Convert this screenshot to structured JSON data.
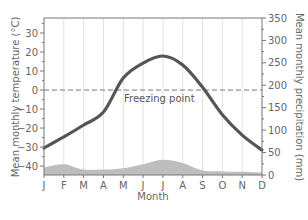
{
  "chart_data": {
    "type": "line",
    "title": "",
    "xlabel": "Month",
    "ylabel": "Mean monthly temperature (°C)",
    "y2label": "Mean monthly precipitation (mm)",
    "categories": [
      "J",
      "F",
      "M",
      "A",
      "M",
      "J",
      "J",
      "A",
      "S",
      "O",
      "N",
      "D"
    ],
    "series": [
      {
        "name": "Mean monthly temperature (°C)",
        "type": "line",
        "axis": "left",
        "color": "#555555",
        "values": [
          -30.5,
          -24.7,
          -18.4,
          -11.6,
          6.3,
          14.2,
          17.9,
          13.2,
          1.5,
          -13.0,
          -23.7,
          -31.6
        ]
      },
      {
        "name": "Mean monthly precipitation (mm)",
        "type": "area",
        "axis": "right",
        "color": "#bdbdbd",
        "values": [
          17,
          24,
          12,
          12,
          15,
          24,
          34,
          27,
          10,
          8,
          7,
          5
        ]
      }
    ],
    "ylim": [
      -44.7,
      37.9
    ],
    "y2lim": [
      0,
      350
    ],
    "yticks": [
      30,
      20,
      10,
      0,
      -10,
      -20,
      -30,
      -40
    ],
    "y2ticks": [
      350,
      300,
      250,
      200,
      150,
      100,
      50,
      0
    ],
    "annotations": [
      {
        "text": "Freezing point",
        "y": 0,
        "style": "dashed-line"
      }
    ],
    "grid": {
      "vertical": true,
      "horizontal": false
    },
    "legend": "none"
  },
  "labels": {
    "xlabel": "Month",
    "ylabel": "Mean monthly temperature (°C)",
    "y2label": "Mean monthly precipitation (mm)",
    "freezing": "Freezing point"
  }
}
